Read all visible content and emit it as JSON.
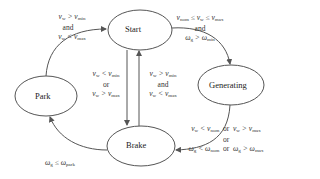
{
  "diagram": {
    "type": "state-machine",
    "colors": {
      "stroke": "#555555",
      "text": "#222222",
      "background": "#ffffff"
    },
    "states": [
      {
        "id": "start",
        "label": "Start"
      },
      {
        "id": "generating",
        "label": "Generating"
      },
      {
        "id": "brake",
        "label": "Brake"
      },
      {
        "id": "park",
        "label": "Park"
      }
    ],
    "transitions": [
      {
        "from": "park",
        "to": "start",
        "condition": "v_w > v_min and v_w < v_max"
      },
      {
        "from": "start",
        "to": "generating",
        "condition": "v_nom ≤ v_w ≤ v_max and ω_g > ω_min"
      },
      {
        "from": "start",
        "to": "brake",
        "condition": "v_w < v_min or v_w > v_max"
      },
      {
        "from": "brake",
        "to": "start",
        "condition": "v_w > v_min and v_w < v_max"
      },
      {
        "from": "generating",
        "to": "brake",
        "condition": "v_w < v_nom or v_w > v_max or ω_g < ω_nom or ω_g > ω_max"
      },
      {
        "from": "brake",
        "to": "park",
        "condition": "ω_g ≤ ω_park"
      }
    ],
    "words": {
      "and": "and",
      "or": "or"
    }
  }
}
